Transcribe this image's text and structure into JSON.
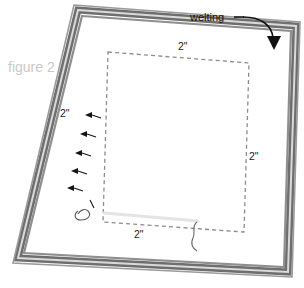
{
  "figure": {
    "label": "figure 2"
  },
  "callouts": [
    {
      "name": "welting",
      "label": "welting"
    }
  ],
  "dimensions": [
    {
      "name": "top-seam-allowance",
      "label": "2\""
    },
    {
      "name": "left-seam-allowance",
      "label": "2\""
    },
    {
      "name": "right-seam-allowance",
      "label": "2\""
    },
    {
      "name": "bottom-seam-allowance",
      "label": "2\""
    }
  ],
  "colors": {
    "background": "#ffffff",
    "welting_dark": "#6e6e6e",
    "welting_mid": "#8a8a8a",
    "welting_light": "#d8d8d8",
    "stitch_line": "#8c8c8c",
    "opening_line": "#e2e2e2",
    "pin_mark": "#151515",
    "callout_text": "#111111",
    "dimension_text": "#1a1a1a",
    "figure_text": "#c9c9c9"
  },
  "elements": {
    "panel": "fabric-panel",
    "welting_border": "welting-border-band",
    "stitch_rect": "dashed-stitch-line",
    "opening": "opening-segment",
    "pins": "pin-markers",
    "arrow": "welting-callout-arrow"
  }
}
